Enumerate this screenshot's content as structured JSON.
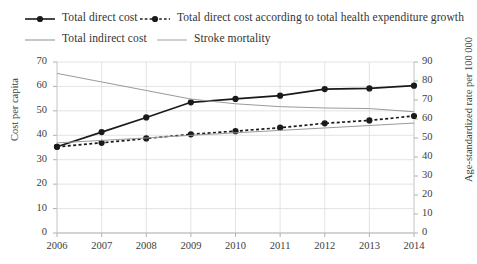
{
  "legend": {
    "items": [
      {
        "label": "Total direct cost",
        "style": "solid-marker",
        "color": "#1a1a1a"
      },
      {
        "label": "Total direct cost according to total health expenditure growth",
        "style": "dashed-marker",
        "color": "#1a1a1a"
      },
      {
        "label": "Total indirect cost",
        "style": "thin-line",
        "color": "#9a9a9a"
      },
      {
        "label": "Stroke mortality",
        "style": "thin-line",
        "color": "#9a9a9a"
      }
    ]
  },
  "chart_data": {
    "type": "line",
    "title": "",
    "xlabel": "",
    "ylabel": "Cost per capita",
    "y2label": "Age-standardized rate per 100 000",
    "categories": [
      "2006",
      "2007",
      "2008",
      "2009",
      "2010",
      "2011",
      "2012",
      "2013",
      "2014"
    ],
    "ylim": [
      0,
      70
    ],
    "yticks": [
      0,
      10,
      20,
      30,
      40,
      50,
      60,
      70
    ],
    "y2lim": [
      0,
      90
    ],
    "y2ticks": [
      0,
      10,
      20,
      30,
      40,
      50,
      60,
      70,
      80,
      90
    ],
    "grid": true,
    "legend_position": "top",
    "series": [
      {
        "name": "Total direct cost",
        "axis": "left",
        "style": "solid",
        "markers": true,
        "color": "#1a1a1a",
        "values": [
          35.3,
          41.3,
          47.3,
          53.5,
          54.9,
          56.2,
          58.9,
          59.2,
          60.3
        ]
      },
      {
        "name": "Total direct cost according to total health expenditure growth",
        "axis": "left",
        "style": "dashed",
        "markers": true,
        "color": "#1a1a1a",
        "values": [
          35.3,
          36.9,
          38.7,
          40.4,
          41.7,
          43.1,
          44.9,
          46.1,
          47.9
        ]
      },
      {
        "name": "Total indirect cost",
        "axis": "left",
        "style": "thin",
        "markers": false,
        "color": "#9a9a9a",
        "values": [
          36.9,
          37.9,
          38.9,
          40.0,
          41.0,
          42.0,
          43.0,
          44.0,
          45.0
        ]
      },
      {
        "name": "Stroke mortality",
        "axis": "right",
        "style": "thin",
        "markers": false,
        "color": "#9a9a9a",
        "values": [
          84.0,
          79.5,
          75.0,
          70.5,
          68.0,
          66.5,
          65.8,
          65.5,
          63.8
        ]
      }
    ]
  }
}
